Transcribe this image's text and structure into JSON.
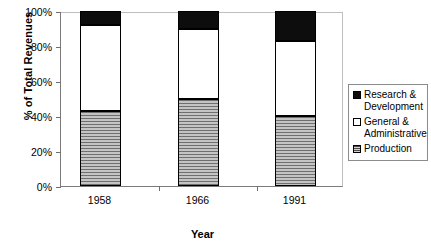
{
  "chart_data": {
    "type": "bar",
    "subtype": "stacked-percent",
    "title": "",
    "xlabel": "Year",
    "ylabel": "% of Total Revenues",
    "categories": [
      "1958",
      "1966",
      "1991"
    ],
    "ylim": [
      0,
      100
    ],
    "yticks": [
      "0%",
      "20%",
      "40%",
      "60%",
      "80%",
      "100%"
    ],
    "ytick_values": [
      0,
      20,
      40,
      60,
      80,
      100
    ],
    "grid": false,
    "legend_position": "right",
    "series": [
      {
        "name": "Research & Development",
        "name_line1": "Research &",
        "name_line2": "Development",
        "swatch": "rd",
        "color": "#0d0d0d",
        "values": [
          8,
          10,
          17
        ]
      },
      {
        "name": "General & Administrative",
        "name_line1": "General &",
        "name_line2": "Administrative",
        "swatch": "ga",
        "color": "#ffffff",
        "values": [
          49,
          40,
          43
        ]
      },
      {
        "name": "Production",
        "name_line1": "Production",
        "name_line2": "",
        "swatch": "prod",
        "color": "#9a9a9a",
        "values": [
          43,
          50,
          40
        ]
      }
    ],
    "stacked_tops": {
      "production": [
        43,
        50,
        40
      ],
      "general_administrative": [
        92,
        90,
        83
      ],
      "research_development": [
        100,
        100,
        100
      ]
    }
  }
}
